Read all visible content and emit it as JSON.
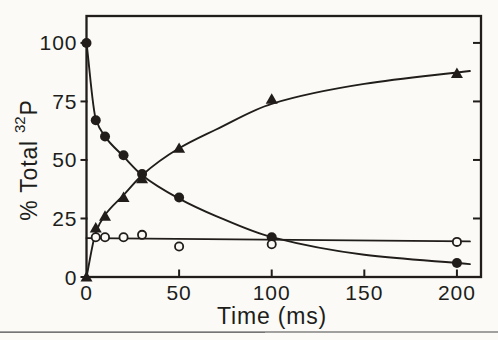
{
  "figure": {
    "ylabel_prefix": "% Total",
    "ylabel_isotope": "32",
    "ylabel_element": "P",
    "ink": "#201d1a",
    "paper": "#fbfaf7",
    "scan_line_color": "#8f8f8f"
  },
  "chart_data": {
    "type": "scatter",
    "title": "",
    "xlabel": "Time (ms)",
    "ylabel": "% Total 32P",
    "xlim": [
      0,
      213
    ],
    "ylim": [
      0,
      111.5
    ],
    "xticks": [
      0,
      50,
      100,
      150,
      200
    ],
    "yticks": [
      0,
      25,
      50,
      75,
      100
    ],
    "grid": false,
    "legend": "none",
    "series": [
      {
        "name": "filled-circles-decay",
        "marker": "filled-circle",
        "points": [
          [
            0,
            100
          ],
          [
            5,
            67
          ],
          [
            10,
            60
          ],
          [
            20,
            52
          ],
          [
            30,
            44
          ],
          [
            50,
            34
          ],
          [
            100,
            17
          ],
          [
            200,
            6
          ]
        ],
        "curve": [
          [
            0,
            100
          ],
          [
            5,
            67.5
          ],
          [
            10,
            60
          ],
          [
            20,
            51.5
          ],
          [
            30,
            43.5
          ],
          [
            50,
            33.5
          ],
          [
            70,
            26
          ],
          [
            100,
            17
          ],
          [
            150,
            9.5
          ],
          [
            207,
            5.5
          ]
        ]
      },
      {
        "name": "filled-triangles-rise",
        "marker": "filled-triangle",
        "points": [
          [
            0,
            0
          ],
          [
            5,
            21
          ],
          [
            10,
            26
          ],
          [
            20,
            34
          ],
          [
            30,
            42
          ],
          [
            50,
            55
          ],
          [
            100,
            76
          ],
          [
            200,
            87
          ]
        ],
        "curve": [
          [
            0,
            0
          ],
          [
            5,
            19
          ],
          [
            10,
            26.5
          ],
          [
            20,
            35
          ],
          [
            30,
            43.5
          ],
          [
            50,
            55
          ],
          [
            70,
            63
          ],
          [
            100,
            74
          ],
          [
            150,
            82.5
          ],
          [
            207,
            88
          ]
        ]
      },
      {
        "name": "open-circles-constant",
        "marker": "open-circle",
        "points": [
          [
            5,
            17
          ],
          [
            10,
            17
          ],
          [
            20,
            17
          ],
          [
            30,
            18
          ],
          [
            50,
            13
          ],
          [
            100,
            14
          ],
          [
            200,
            15
          ]
        ],
        "curve": [
          [
            0,
            16.6
          ],
          [
            207,
            15.2
          ]
        ]
      }
    ]
  }
}
